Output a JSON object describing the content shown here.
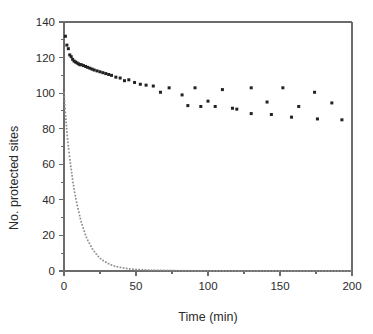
{
  "chart_data": {
    "type": "scatter",
    "title": "",
    "subtitle": "",
    "xlabel": "Time (min)",
    "ylabel": "No. protected sites",
    "xlim": [
      0,
      200
    ],
    "ylim": [
      0,
      140
    ],
    "xticks": [
      0,
      50,
      100,
      150,
      200
    ],
    "yticks": [
      0,
      20,
      40,
      60,
      80,
      100,
      120,
      140
    ],
    "xticklabels": [
      "0",
      "50",
      "100",
      "150",
      "200"
    ],
    "yticklabels": [
      "0",
      "20",
      "40",
      "60",
      "80",
      "100",
      "120",
      "140"
    ],
    "grid": false,
    "legend": null,
    "legend_position": "none",
    "annotations": [],
    "series": [
      {
        "name": "protected sites (data)",
        "type": "scatter",
        "marker": "square",
        "color": "#222222",
        "points": [
          [
            1.0,
            132.0
          ],
          [
            2.0,
            127.0
          ],
          [
            3.0,
            125.0
          ],
          [
            4.0,
            121.5
          ],
          [
            5.0,
            120.5
          ],
          [
            6.0,
            119.0
          ],
          [
            7.0,
            118.0
          ],
          [
            8.0,
            117.5
          ],
          [
            9.0,
            117.0
          ],
          [
            10.0,
            116.5
          ],
          [
            11.0,
            116.0
          ],
          [
            12.0,
            116.0
          ],
          [
            13.5,
            115.5
          ],
          [
            15.0,
            115.0
          ],
          [
            16.5,
            114.5
          ],
          [
            18.0,
            114.0
          ],
          [
            19.5,
            113.5
          ],
          [
            21.0,
            113.0
          ],
          [
            23.0,
            112.5
          ],
          [
            25.0,
            112.0
          ],
          [
            27.0,
            111.5
          ],
          [
            29.0,
            111.0
          ],
          [
            31.0,
            110.5
          ],
          [
            33.0,
            110.0
          ],
          [
            36.0,
            109.0
          ],
          [
            39.0,
            108.5
          ],
          [
            42.0,
            107.0
          ],
          [
            45.0,
            107.5
          ],
          [
            49.0,
            106.0
          ],
          [
            53.0,
            105.0
          ],
          [
            57.0,
            104.5
          ],
          [
            62.0,
            104.0
          ],
          [
            67.0,
            100.5
          ],
          [
            73.0,
            103.0
          ],
          [
            82.0,
            99.0
          ],
          [
            91.0,
            103.0
          ],
          [
            100.0,
            95.5
          ],
          [
            110.0,
            102.0
          ],
          [
            120.0,
            91.0
          ],
          [
            130.0,
            103.0
          ],
          [
            141.0,
            95.0
          ],
          [
            152.0,
            103.0
          ],
          [
            163.0,
            92.5
          ],
          [
            174.0,
            100.5
          ],
          [
            186.0,
            94.5
          ],
          [
            193.0,
            85.0
          ],
          [
            176.0,
            85.5
          ],
          [
            158.0,
            86.5
          ],
          [
            144.0,
            88.0
          ],
          [
            130.0,
            88.5
          ],
          [
            117.0,
            91.5
          ],
          [
            105.0,
            92.5
          ],
          [
            95.0,
            92.5
          ],
          [
            86.0,
            93.0
          ]
        ]
      },
      {
        "name": "fitted decay (dotted)",
        "type": "line",
        "style": "dotted",
        "color": "#8d8d8d",
        "description": "Exponential decay from about 100 at t=0 toward 0 by t=60, remaining near 0 out to t=200",
        "points": [
          [
            0.0,
            100.0
          ],
          [
            1.0,
            88.0
          ],
          [
            2.0,
            78.0
          ],
          [
            3.0,
            70.0
          ],
          [
            4.0,
            63.0
          ],
          [
            5.0,
            57.0
          ],
          [
            6.0,
            51.0
          ],
          [
            7.0,
            46.0
          ],
          [
            8.0,
            41.5
          ],
          [
            9.0,
            37.5
          ],
          [
            10.0,
            34.0
          ],
          [
            11.0,
            30.5
          ],
          [
            12.0,
            27.5
          ],
          [
            13.0,
            25.0
          ],
          [
            14.0,
            22.5
          ],
          [
            15.0,
            20.0
          ],
          [
            16.0,
            18.0
          ],
          [
            17.0,
            16.5
          ],
          [
            18.0,
            15.0
          ],
          [
            19.0,
            13.5
          ],
          [
            20.0,
            12.0
          ],
          [
            22.0,
            10.0
          ],
          [
            24.0,
            8.0
          ],
          [
            26.0,
            6.5
          ],
          [
            28.0,
            5.5
          ],
          [
            30.0,
            4.5
          ],
          [
            34.0,
            3.0
          ],
          [
            38.0,
            2.2
          ],
          [
            42.0,
            1.6
          ],
          [
            46.0,
            1.2
          ],
          [
            50.0,
            0.9
          ],
          [
            60.0,
            0.5
          ],
          [
            80.0,
            0.2
          ],
          [
            100.0,
            0.1
          ],
          [
            150.0,
            0.05
          ],
          [
            200.0,
            0.02
          ]
        ]
      }
    ]
  },
  "axes": {
    "ylabel": "No. protected sites",
    "xlabel": "Time (min)"
  }
}
